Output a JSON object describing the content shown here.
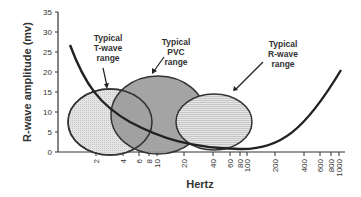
{
  "chart_data": {
    "type": "diagram-chart",
    "title": "",
    "xlabel": "Hertz",
    "ylabel": "R-wave amplitude (mv)",
    "x_scale": "log",
    "x_ticks": [
      "2",
      "4",
      "6",
      "8",
      "10",
      "20",
      "40",
      "60",
      "80",
      "100",
      "200",
      "400",
      "600",
      "800",
      "1000"
    ],
    "y_ticks": [
      "0",
      "5",
      "10",
      "15",
      "20",
      "25",
      "30",
      "35"
    ],
    "ylim": [
      0,
      35
    ],
    "regions": [
      {
        "name": "Typical T-wave range",
        "label_lines": [
          "Typical",
          "T-wave",
          "range"
        ],
        "x_range_hz": [
          1,
          6
        ],
        "y_range_mv": [
          0,
          16
        ],
        "fill": "#d9d9d9",
        "pattern": "grid"
      },
      {
        "name": "Typical PVC range",
        "label_lines": [
          "Typical",
          "PVC",
          "range"
        ],
        "x_range_hz": [
          3,
          30
        ],
        "y_range_mv": [
          0,
          19
        ],
        "fill": "#9a9a9a",
        "pattern": "solid"
      },
      {
        "name": "Typical R-wave range",
        "label_lines": [
          "Typical",
          "R-wave",
          "range"
        ],
        "x_range_hz": [
          20,
          120
        ],
        "y_range_mv": [
          0,
          14
        ],
        "fill": "#dcdcdc",
        "pattern": "horizontal-lines"
      }
    ],
    "curve": {
      "name": "filter response curve",
      "points": [
        [
          1,
          27
        ],
        [
          2,
          16
        ],
        [
          4,
          9
        ],
        [
          10,
          5
        ],
        [
          20,
          3
        ],
        [
          40,
          1.5
        ],
        [
          100,
          1
        ],
        [
          200,
          2
        ],
        [
          400,
          6
        ],
        [
          800,
          14
        ],
        [
          1000,
          19
        ]
      ]
    },
    "grid": false,
    "legend": "none"
  }
}
